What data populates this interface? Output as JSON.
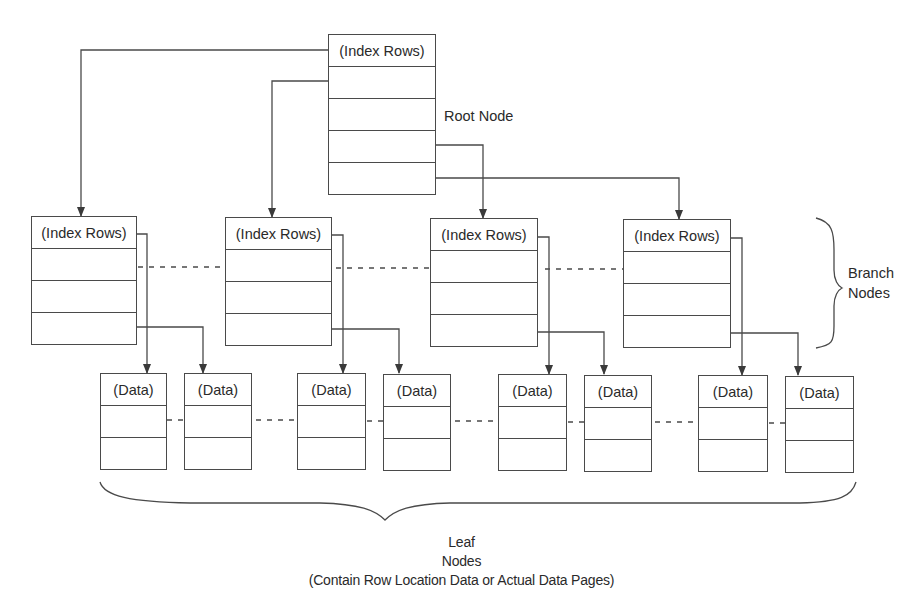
{
  "diagram": {
    "type": "b-tree-index",
    "root": {
      "label": "Root Node",
      "header": "(Index Rows)",
      "row_count": 5
    },
    "branch": {
      "label_line1": "Branch",
      "label_line2": "Nodes",
      "nodes": [
        {
          "header": "(Index Rows)"
        },
        {
          "header": "(Index Rows)"
        },
        {
          "header": "(Index Rows)"
        },
        {
          "header": "(Index Rows)"
        }
      ]
    },
    "leaf": {
      "label_line1": "Leaf",
      "label_line2": "Nodes",
      "label_line3": "(Contain Row Location Data or Actual Data Pages)",
      "nodes": [
        {
          "header": "(Data)"
        },
        {
          "header": "(Data)"
        },
        {
          "header": "(Data)"
        },
        {
          "header": "(Data)"
        },
        {
          "header": "(Data)"
        },
        {
          "header": "(Data)"
        },
        {
          "header": "(Data)"
        },
        {
          "header": "(Data)"
        }
      ]
    },
    "colors": {
      "line": "#4a4a4a",
      "text": "#2a2a2a",
      "background": "#ffffff"
    }
  }
}
